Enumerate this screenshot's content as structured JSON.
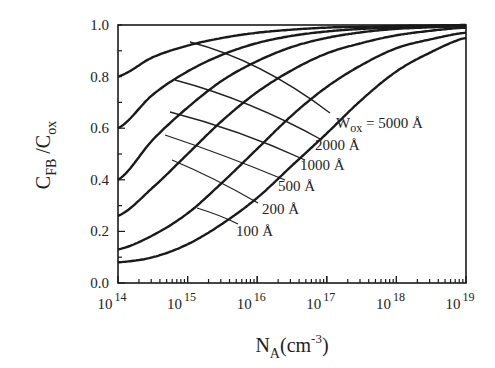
{
  "chart_data": {
    "type": "line",
    "title": "",
    "xlabel": "N_A(cm^-3)",
    "xlabel_parts": {
      "main": "N",
      "sub": "A",
      "rest": "(cm",
      "sup": "-3",
      "close": ")"
    },
    "ylabel": "C_FB/C_ox",
    "ylabel_parts": {
      "c1": "C",
      "sub1": "FB",
      "slash": " /C",
      "sub2": "ox"
    },
    "xscale": "log",
    "xlim": [
      100000000000000.0,
      1e+19
    ],
    "ylim": [
      0.0,
      1.0
    ],
    "grid": false,
    "legend": "inline labels with leader lines",
    "x_ticks": [
      {
        "base": "10",
        "exp": "14",
        "log": 14
      },
      {
        "base": "10",
        "exp": "15",
        "log": 15
      },
      {
        "base": "10",
        "exp": "16",
        "log": 16
      },
      {
        "base": "10",
        "exp": "17",
        "log": 17
      },
      {
        "base": "10",
        "exp": "18",
        "log": 18
      },
      {
        "base": "10",
        "exp": "19",
        "log": 19
      }
    ],
    "y_ticks": [
      "0.0",
      "0.2",
      "0.4",
      "0.6",
      "0.8",
      "1.0"
    ],
    "x_log": [
      14,
      14.5,
      15,
      15.5,
      16,
      16.5,
      17,
      17.5,
      18,
      18.5,
      19
    ],
    "series": [
      {
        "name": "Wox = 5000 Å",
        "label": "W",
        "label_sub": "ox",
        "label_rest": " = 5000 Å",
        "values": [
          0.8,
          0.875,
          0.92,
          0.95,
          0.97,
          0.982,
          0.99,
          0.993,
          0.996,
          0.998,
          1.0
        ]
      },
      {
        "name": "2000 Å",
        "label": "2000 Å",
        "values": [
          0.6,
          0.73,
          0.82,
          0.885,
          0.93,
          0.958,
          0.975,
          0.985,
          0.99,
          0.995,
          0.998
        ]
      },
      {
        "name": "1000 Å",
        "label": "1000 Å",
        "values": [
          0.4,
          0.555,
          0.68,
          0.785,
          0.86,
          0.915,
          0.95,
          0.972,
          0.985,
          0.991,
          0.995
        ]
      },
      {
        "name": "500 Å",
        "label": "500 Å",
        "values": [
          0.26,
          0.37,
          0.5,
          0.63,
          0.74,
          0.825,
          0.89,
          0.93,
          0.96,
          0.978,
          0.99
        ]
      },
      {
        "name": "200 Å",
        "label": "200 Å",
        "values": [
          0.13,
          0.185,
          0.27,
          0.39,
          0.52,
          0.65,
          0.76,
          0.845,
          0.91,
          0.945,
          0.97
        ]
      },
      {
        "name": "100 Å",
        "label": "100 Å",
        "values": [
          0.08,
          0.1,
          0.15,
          0.23,
          0.33,
          0.455,
          0.58,
          0.71,
          0.82,
          0.895,
          0.95
        ]
      }
    ]
  },
  "colors": {
    "line": "#1a1a1a",
    "text": "#222222",
    "background": "#ffffff"
  }
}
